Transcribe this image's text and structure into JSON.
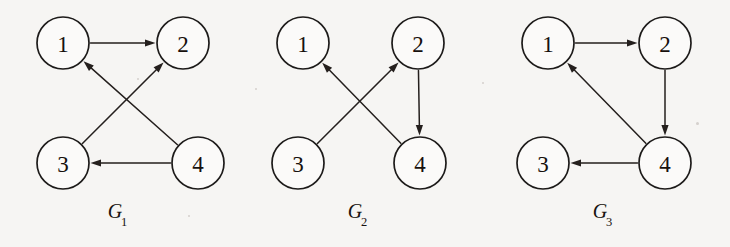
{
  "figure": {
    "background_color": "#f6f5f3",
    "stroke_color": "#241f1d",
    "node_fill": "#fbfaf9",
    "node_radius": 26,
    "width": 730,
    "height": 247
  },
  "graphs": [
    {
      "id": "G1",
      "caption_letter": "G",
      "caption_subscript": "1",
      "caption_x": 118,
      "caption_y": 200,
      "nodes": [
        {
          "label": "1",
          "x": 63,
          "y": 43
        },
        {
          "label": "2",
          "x": 183,
          "y": 43
        },
        {
          "label": "3",
          "x": 63,
          "y": 163
        },
        {
          "label": "4",
          "x": 198,
          "y": 163
        }
      ],
      "edges": [
        {
          "from": "1",
          "to": "2"
        },
        {
          "from": "3",
          "to": "2"
        },
        {
          "from": "4",
          "to": "1"
        },
        {
          "from": "4",
          "to": "3"
        }
      ]
    },
    {
      "id": "G2",
      "caption_letter": "G",
      "caption_subscript": "2",
      "caption_x": 358,
      "caption_y": 200,
      "nodes": [
        {
          "label": "1",
          "x": 303,
          "y": 43
        },
        {
          "label": "2",
          "x": 418,
          "y": 43
        },
        {
          "label": "3",
          "x": 298,
          "y": 163
        },
        {
          "label": "4",
          "x": 420,
          "y": 163
        }
      ],
      "edges": [
        {
          "from": "3",
          "to": "2"
        },
        {
          "from": "4",
          "to": "1"
        },
        {
          "from": "2",
          "to": "4"
        }
      ]
    },
    {
      "id": "G3",
      "caption_letter": "G",
      "caption_subscript": "3",
      "caption_x": 603,
      "caption_y": 200,
      "nodes": [
        {
          "label": "1",
          "x": 548,
          "y": 43
        },
        {
          "label": "2",
          "x": 665,
          "y": 43
        },
        {
          "label": "3",
          "x": 543,
          "y": 163
        },
        {
          "label": "4",
          "x": 665,
          "y": 163
        }
      ],
      "edges": [
        {
          "from": "1",
          "to": "2"
        },
        {
          "from": "2",
          "to": "4"
        },
        {
          "from": "4",
          "to": "1"
        },
        {
          "from": "4",
          "to": "3"
        }
      ]
    }
  ],
  "specks": [
    {
      "x": 137,
      "y": 78,
      "size": 2
    },
    {
      "x": 255,
      "y": 88,
      "size": 2
    },
    {
      "x": 482,
      "y": 82,
      "size": 2
    },
    {
      "x": 696,
      "y": 122,
      "size": 3
    },
    {
      "x": 188,
      "y": 215,
      "size": 2
    }
  ]
}
